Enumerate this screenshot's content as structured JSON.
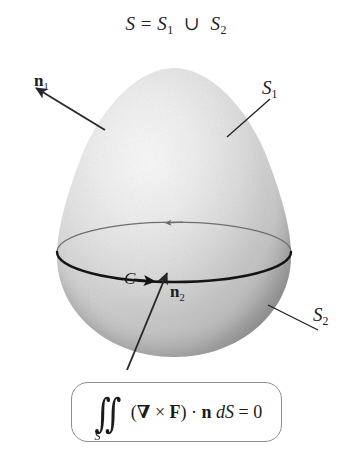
{
  "figure": {
    "title": {
      "lhs": "S",
      "eq": "=",
      "s1": "S",
      "s1_sub": "1",
      "union": "∪",
      "s2": "S",
      "s2_sub": "2",
      "full": "S = S1 ∪ S2"
    },
    "labels": {
      "n1": "n",
      "n1_sub": "1",
      "n2": "n",
      "n2_sub": "2",
      "S1": "S",
      "S1_sub": "1",
      "S2": "S",
      "S2_sub": "2",
      "C": "C"
    },
    "formula": {
      "integral": "∬",
      "integral_sub": "S",
      "open_paren": "(",
      "nabla": "∇",
      "cross": "×",
      "F": "F",
      "close_paren": ")",
      "dot": "·",
      "n": "n",
      "dS": "dS",
      "equals": "=",
      "zero": "0",
      "full": "∬_S (∇ × F) · n dS = 0"
    },
    "colors": {
      "surface_light": "#f7f7f7",
      "surface_mid": "#d2d2d2",
      "surface_dark": "#9d9d9d",
      "curve_front": "#1b1b1b",
      "curve_back": "#6f6f6f",
      "arrow": "#2a2a2a",
      "leader": "#202020",
      "box_border": "#8d8d8d",
      "text": "#1a1a1a",
      "background": "#ffffff"
    },
    "geometry": {
      "egg_center_x": 174,
      "egg_top_y": 68,
      "egg_bottom_y": 357,
      "egg_left_x": 57,
      "egg_right_x": 291,
      "curve_center_y": 250,
      "curve_rx": 117,
      "curve_ry": 30
    }
  }
}
